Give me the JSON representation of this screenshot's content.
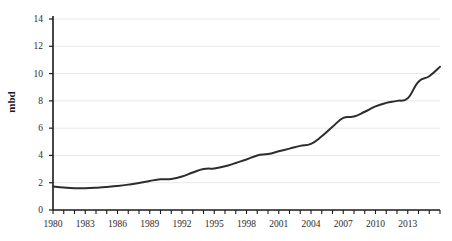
{
  "chart_data": {
    "type": "line",
    "title": "",
    "subtitle": "",
    "xlabel": "",
    "ylabel": "mbd",
    "xlim": [
      1980,
      2016
    ],
    "ylim": [
      0,
      14
    ],
    "ytick_values": [
      0,
      2,
      4,
      6,
      8,
      10,
      12,
      14
    ],
    "ytick_labels": [
      "0",
      "2",
      "4",
      "6",
      "8",
      "10",
      "12",
      "14"
    ],
    "xtick_labels": [
      "1980",
      "1983",
      "1986",
      "1989",
      "1992",
      "1995",
      "1998",
      "2001",
      "2004",
      "2007",
      "2010",
      "2013"
    ],
    "xtick_values": [
      1980,
      1983,
      1986,
      1989,
      1992,
      1995,
      1998,
      2001,
      2004,
      2007,
      2010,
      2013
    ],
    "x_minor_tick_step": 1,
    "grid": "horizontal",
    "grid_color": "#e8e8e8",
    "legend": null,
    "legend_position": "none",
    "line_color": "#2d2d2d",
    "line_width": 2,
    "x": [
      1980,
      1981,
      1982,
      1983,
      1984,
      1985,
      1986,
      1987,
      1988,
      1989,
      1990,
      1991,
      1992,
      1993,
      1994,
      1995,
      1996,
      1997,
      1998,
      1999,
      2000,
      2001,
      2002,
      2003,
      2004,
      2005,
      2006,
      2007,
      2008,
      2009,
      2010,
      2011,
      2012,
      2013,
      2014,
      2015,
      2016
    ],
    "values": [
      1.72,
      1.65,
      1.6,
      1.6,
      1.63,
      1.68,
      1.76,
      1.86,
      1.98,
      2.13,
      2.25,
      2.28,
      2.45,
      2.75,
      3.0,
      3.05,
      3.2,
      3.45,
      3.7,
      4.0,
      4.1,
      4.3,
      4.5,
      4.7,
      4.85,
      5.4,
      6.1,
      6.75,
      6.85,
      7.2,
      7.6,
      7.85,
      8.0,
      8.2,
      9.4,
      9.8,
      10.5
    ],
    "series_name": "mbd"
  }
}
